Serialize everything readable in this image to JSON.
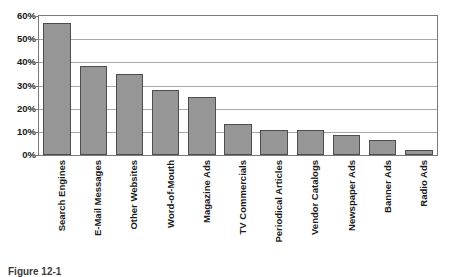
{
  "figure": {
    "caption": "Figure 12-1"
  },
  "chart_data": {
    "type": "bar",
    "title": "",
    "xlabel": "",
    "ylabel": "",
    "ylim": [
      0,
      60
    ],
    "grid": true,
    "legend": "none",
    "orientation": "vertical",
    "value_suffix": "%",
    "bar_color": "#969696",
    "bar_border_color": "#4d4d4d",
    "gridline_color": "#a8a8a8",
    "frame_color": "#7a7a7a",
    "y_ticks": [
      {
        "value": 0,
        "label": "0%"
      },
      {
        "value": 10,
        "label": "10%"
      },
      {
        "value": 20,
        "label": "20%"
      },
      {
        "value": 30,
        "label": "30%"
      },
      {
        "value": 40,
        "label": "40%"
      },
      {
        "value": 50,
        "label": "50%"
      },
      {
        "value": 60,
        "label": "60%"
      }
    ],
    "categories": [
      "Search Engines",
      "E-Mail Messages",
      "Other Websites",
      "Word-of-Mouth",
      "Magazine Ads",
      "TV Commercials",
      "Periodical Articles",
      "Vendor Catalogs",
      "Newspaper Ads",
      "Banner Ads",
      "Radio Ads"
    ],
    "values": [
      57,
      38.5,
      35,
      28,
      25,
      13.5,
      11,
      11,
      8.5,
      6.5,
      2
    ]
  }
}
